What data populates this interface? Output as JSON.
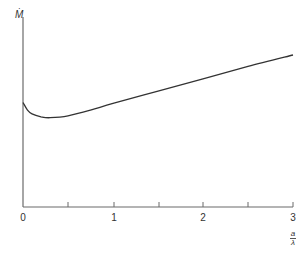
{
  "chart_data": {
    "type": "line",
    "title": "",
    "xlabel": "a/λ",
    "xlabel_numerator": "a",
    "xlabel_denominator": "λ",
    "ylabel": "Ṁ",
    "ylabel_symbol": "M",
    "ylabel_dot": "·",
    "xlim": [
      0,
      3
    ],
    "x_ticks": [
      "0",
      "1",
      "2",
      "3"
    ],
    "x_minor_ticks": [
      0.5,
      1.5,
      2.5
    ],
    "grid": false,
    "legend": null,
    "series": [
      {
        "name": "Ṁ",
        "x": [
          0,
          0.05,
          0.1,
          0.2,
          0.3,
          0.5,
          0.75,
          1.0,
          1.5,
          2.0,
          2.5,
          3.0
        ],
        "y": [
          0.55,
          0.51,
          0.49,
          0.475,
          0.47,
          0.48,
          0.51,
          0.545,
          0.61,
          0.675,
          0.74,
          0.8
        ]
      }
    ],
    "y_axis_note": "relative units, no tick labels (axis height = 1.0)"
  },
  "labels": {
    "x_tick_0": "0",
    "x_tick_1": "1",
    "x_tick_2": "2",
    "x_tick_3": "3"
  },
  "colors": {
    "axis": "#6b6b6b",
    "curve": "#333333"
  }
}
